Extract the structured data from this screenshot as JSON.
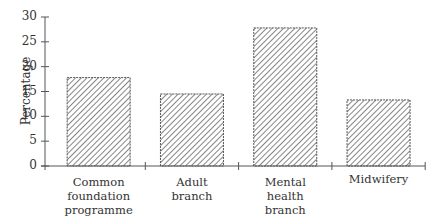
{
  "chart_data": {
    "type": "bar",
    "title": "",
    "xlabel": "",
    "ylabel": "Percentage",
    "ylim": [
      0,
      30
    ],
    "yticks": [
      0,
      5,
      10,
      15,
      20,
      25,
      30
    ],
    "grid": false,
    "legend": null,
    "bar_fill": "diagonal hatching",
    "categories": [
      "Common foundation programme",
      "Adult branch",
      "Mental health branch",
      "Midwifery"
    ],
    "category_label_lines": [
      [
        "Common",
        "foundation",
        "programme"
      ],
      [
        "Adult",
        "branch"
      ],
      [
        "Mental",
        "health",
        "branch"
      ],
      [
        "Midwifery"
      ]
    ],
    "values": [
      17.8,
      14.5,
      27.8,
      13.3
    ]
  },
  "colors": {
    "axis": "#555555",
    "hatch": "#444444",
    "bar_border": "#555555"
  }
}
